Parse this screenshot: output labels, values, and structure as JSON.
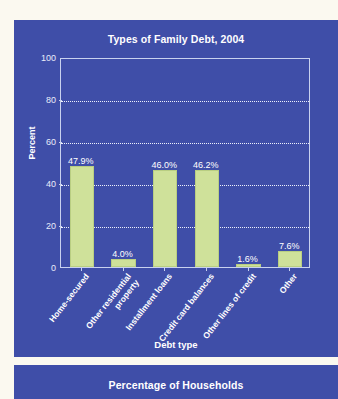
{
  "page": {
    "background_color": "#fbf9f0",
    "panel_color": "#3f4ea8"
  },
  "main_panel": {
    "title": "Types of Family Debt, 2004"
  },
  "secondary_panel": {
    "title": "Percentage of Households"
  },
  "chart_data": {
    "type": "bar",
    "title": "Types of Family Debt, 2004",
    "xlabel": "Debt type",
    "ylabel": "Percent",
    "ylim": [
      0,
      100
    ],
    "yticks": [
      0,
      20,
      40,
      60,
      80,
      100
    ],
    "grid": true,
    "grid_style": "dotted-horizontal",
    "legend": null,
    "bar_color": "#cfe19a",
    "categories": [
      "Home-secured",
      "Other residential\nproperty",
      "Installment loans",
      "Credit card balances",
      "Other lines of credit",
      "Other"
    ],
    "values": [
      47.9,
      4.0,
      46.0,
      46.2,
      1.6,
      7.6
    ],
    "value_labels": [
      "47.9%",
      "4.0%",
      "46.0%",
      "46.2%",
      "1.6%",
      "7.6%"
    ]
  }
}
